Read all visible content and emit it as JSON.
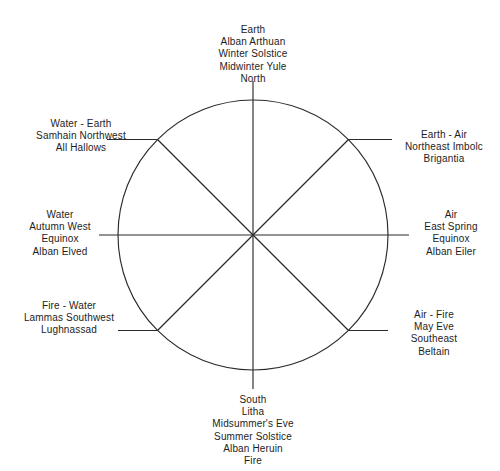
{
  "diagram": {
    "type": "eight-spoke-wheel",
    "colors": {
      "background": "#ffffff",
      "stroke": "#2b2b2b",
      "text": "#1d1d1d"
    },
    "geometry": {
      "center_x": 253,
      "center_y": 235,
      "radius": 135
    },
    "spokes": [
      {
        "direction": "north",
        "angle_deg": 90,
        "label": "Earth\nAlban Arthuan\nWinter Solstice\nMidwinter  Yule\nNorth"
      },
      {
        "direction": "northeast",
        "angle_deg": 45,
        "label": "Earth - Air\nNortheast Imbolc\nBrigantia"
      },
      {
        "direction": "east",
        "angle_deg": 0,
        "label": "Air\nEast   Spring\nEquinox\nAlban Eiler"
      },
      {
        "direction": "southeast",
        "angle_deg": -45,
        "label": "Air - Fire\nMay Eve\nSoutheast\nBeltain"
      },
      {
        "direction": "south",
        "angle_deg": -90,
        "label": "South\nLitha\nMidsummer's Eve\nSummer Solstice\nAlban Heruin\nFire"
      },
      {
        "direction": "southwest",
        "angle_deg": -135,
        "label": "Fire - Water\nLammas Southwest\nLughnassad"
      },
      {
        "direction": "west",
        "angle_deg": 180,
        "label": "Water\nAutumn   West\nEquinox\nAlban Elved"
      },
      {
        "direction": "northwest",
        "angle_deg": 135,
        "label": "Water - Earth\nSamhain Northwest\nAll Hallows"
      }
    ]
  }
}
